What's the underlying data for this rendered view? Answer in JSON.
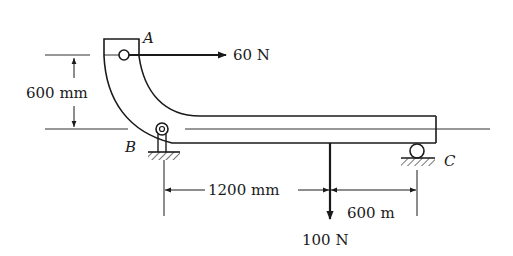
{
  "diagram": {
    "type": "mechanics-free-body-problem",
    "colors": {
      "ink": "#1a1a1a",
      "background": "#ffffff"
    },
    "points": {
      "A": {
        "label": "A",
        "support": "pin-hole at top of curved member"
      },
      "B": {
        "label": "B",
        "support": "pin support"
      },
      "C": {
        "label": "C",
        "support": "roller support"
      }
    },
    "forces": [
      {
        "label": "60 N",
        "direction": "right",
        "applied_at": "A"
      },
      {
        "label": "100 N",
        "direction": "down",
        "applied_at": "beam, 1200 mm right of B"
      }
    ],
    "dimensions": [
      {
        "label": "600 mm",
        "orientation": "vertical",
        "between": "A and beam axis"
      },
      {
        "label": "1200 mm",
        "orientation": "horizontal",
        "between": "B and 100 N load"
      },
      {
        "label": "600 m",
        "orientation": "horizontal",
        "between": "100 N load and C"
      }
    ]
  }
}
